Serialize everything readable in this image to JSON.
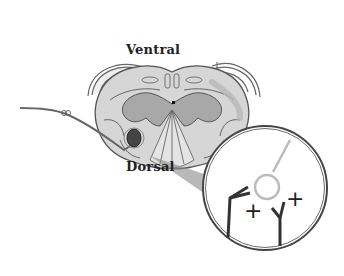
{
  "diagram": {
    "type": "anatomical cross-section",
    "labels": {
      "ventral": "Ventral",
      "dorsal": "Dorsal"
    },
    "inset": {
      "description": "magnified view of electrode tip near neurons",
      "symbols": [
        "+",
        "+"
      ]
    },
    "colors": {
      "white_matter": "#d6d6d6",
      "gray_matter": "#a8a8a8",
      "outline": "#555555",
      "electrode": "#666666",
      "highlight": "#bfbfbf"
    }
  }
}
